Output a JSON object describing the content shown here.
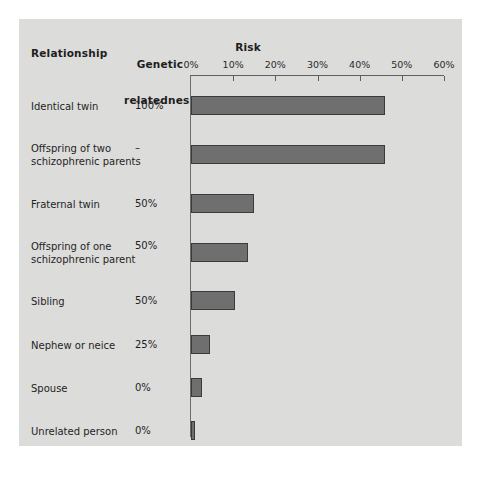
{
  "figure": {
    "background": "#ffffff",
    "panel_color": "#dcdcdb",
    "bar_fill": "#6f6f6f",
    "bar_stroke": "#3b3b3b",
    "axis_color": "#5f5f5f"
  },
  "headers": {
    "relationship": "Relationship",
    "relatedness_line1": "Genetic",
    "relatedness_line2": "relatedness",
    "risk": "Risk"
  },
  "chart_data": {
    "type": "bar",
    "orientation": "horizontal",
    "title": "Risk",
    "xlabel": "Risk",
    "ylabel": "Relationship",
    "xlim": [
      0,
      60
    ],
    "xticks": [
      0,
      10,
      20,
      30,
      40,
      50,
      60
    ],
    "xtick_labels": [
      "0%",
      "10%",
      "20%",
      "30%",
      "40%",
      "50%",
      "60%"
    ],
    "grid": false,
    "legend": null,
    "categories": [
      "Identical twin",
      "Offspring of two\nschizophrenic parents",
      "Fraternal twin",
      "Offspring of one\nschizophrenic parent",
      "Sibling",
      "Nephew or neice",
      "Spouse",
      "Unrelated person"
    ],
    "values": [
      46,
      46,
      15,
      13.5,
      10.5,
      4.5,
      2.5,
      1
    ],
    "annotations": {
      "genetic_relatedness": [
        "100%",
        "–",
        "50%",
        "50%",
        "50%",
        "25%",
        "0%",
        "0%"
      ]
    }
  },
  "rows": [
    {
      "label": "Identical twin",
      "relatedness": "100%",
      "risk": 46,
      "top": 77,
      "label_top": 81
    },
    {
      "label": "Offspring of two\nschizophrenic parents",
      "relatedness": "–",
      "risk": 46,
      "top": 126,
      "label_top": 123
    },
    {
      "label": "Fraternal twin",
      "relatedness": "50%",
      "risk": 15,
      "top": 175,
      "label_top": 179
    },
    {
      "label": "Offspring of one\nschizophrenic parent",
      "relatedness": "50%",
      "risk": 13.5,
      "top": 224,
      "label_top": 221
    },
    {
      "label": "Sibling",
      "relatedness": "50%",
      "risk": 10.5,
      "top": 272,
      "label_top": 276
    },
    {
      "label": "Nephew or neice",
      "relatedness": "25%",
      "risk": 4.5,
      "top": 316,
      "label_top": 320
    },
    {
      "label": "Spouse",
      "relatedness": "0%",
      "risk": 2.5,
      "top": 359,
      "label_top": 363
    },
    {
      "label": "Unrelated person",
      "relatedness": "0%",
      "risk": 1,
      "top": 402,
      "label_top": 406
    }
  ]
}
